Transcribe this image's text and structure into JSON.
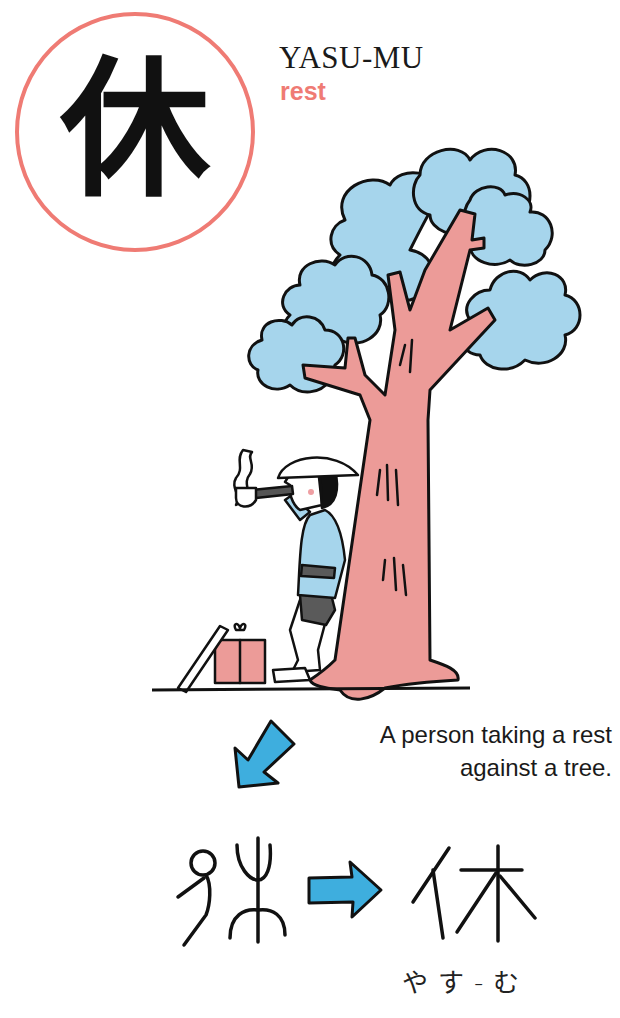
{
  "card": {
    "kanji": "休",
    "reading_romaji": "YASU-MU",
    "meaning": "rest",
    "caption_line1": "A person taking a rest",
    "caption_line2": "against a tree.",
    "reading_kana": "やす-む"
  },
  "evolution": {
    "ancient_form": "pictograph-person-and-tree",
    "modern_form": "休",
    "arrow": "right-arrow"
  },
  "illustration": {
    "scene": "person-smoking-pipe-leaning-against-tree",
    "objects": [
      "tree",
      "person",
      "pipe",
      "smoke",
      "hat",
      "box",
      "walking-stick"
    ]
  },
  "colors": {
    "accent_red": "#ef7b74",
    "trunk_pink": "#ec9b98",
    "foliage_blue": "#a6d5ec",
    "arrow_blue": "#3eaede",
    "ink": "#111111"
  }
}
